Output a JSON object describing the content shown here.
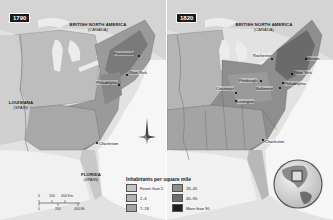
{
  "maps": [
    {
      "year": "1790",
      "regions": [
        {
          "name": "BRITISH NORTH AMERICA",
          "sub": "(CANADA)"
        },
        {
          "name": "LOUISIANA",
          "sub": "(SPAIN)"
        },
        {
          "name": "FLORIDA",
          "sub": "(SPAIN)"
        }
      ],
      "cities": [
        "Portsmouth",
        "New York",
        "Philadelphia",
        "Charleston"
      ]
    },
    {
      "year": "1820",
      "regions": [
        {
          "name": "BRITISH NORTH AMERICA",
          "sub": "(CANADA)"
        }
      ],
      "cities": [
        "Rochester",
        "Boston",
        "New York",
        "Pittsburgh",
        "Philadelphia",
        "Baltimore",
        "Cincinnati",
        "Lexington",
        "Charleston"
      ]
    }
  ],
  "legend": {
    "title": "Inhabitants per square mile",
    "items": [
      {
        "label": "Fewer than 2",
        "color": "#c4c4c4"
      },
      {
        "label": "18–45",
        "color": "#8e8e8e"
      },
      {
        "label": "2–6",
        "color": "#b2b2b2"
      },
      {
        "label": "46–90",
        "color": "#6e6e6e"
      },
      {
        "label": "7–18",
        "color": "#a2a2a2"
      },
      {
        "label": "More than 90",
        "color": "#1e1e1e"
      }
    ]
  },
  "scale": {
    "km_ticks": [
      "0",
      "200",
      "400 Km"
    ],
    "mi_ticks": [
      "0",
      "200",
      "400 Mi"
    ]
  },
  "compass": {
    "north_label": "N"
  },
  "colors": {
    "water": "#f2f2f2",
    "land_outside": "#d6d6d6",
    "lakes": "#e8e8e8",
    "border": "#555555"
  }
}
